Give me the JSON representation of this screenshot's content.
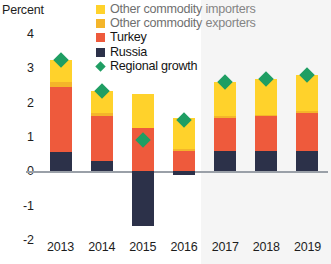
{
  "axis": {
    "y_title": "Percent",
    "y_ticks": [
      "4",
      "3",
      "2",
      "1",
      "0",
      "-1",
      "-2"
    ],
    "x_ticks": [
      "2013",
      "2014",
      "2015",
      "2016",
      "2017",
      "2018",
      "2019"
    ]
  },
  "legend": {
    "items": [
      {
        "label": "Other commodity importers",
        "color": "#FFD22B",
        "shape": "square",
        "muted": true
      },
      {
        "label": "Other commodity exporters",
        "color": "#F4B52A",
        "shape": "square",
        "muted": true
      },
      {
        "label": "Turkey",
        "color": "#EE5A3C",
        "shape": "square",
        "muted": false
      },
      {
        "label": "Russia",
        "color": "#2C3149",
        "shape": "square",
        "muted": false
      },
      {
        "label": "Regional growth",
        "color": "#1F9E63",
        "shape": "diamond",
        "muted": false
      }
    ]
  },
  "colors": {
    "other_importers": "#FFD22B",
    "other_exporters": "#F4B52A",
    "turkey": "#EE5A3C",
    "russia": "#2C3149",
    "regional_growth": "#1F9E63",
    "axis_line": "#9AA0A8",
    "background": "#FFFFFF"
  },
  "chart_data": {
    "type": "bar",
    "title": "",
    "subtitle": "",
    "xlabel": "",
    "ylabel": "Percent",
    "ylim": [
      -2,
      4
    ],
    "yticks": [
      -2,
      -1,
      0,
      1,
      2,
      3,
      4
    ],
    "grid": false,
    "stacked": true,
    "legend_position": "top-right",
    "categories": [
      "2013",
      "2014",
      "2015",
      "2016",
      "2017",
      "2018",
      "2019"
    ],
    "series": [
      {
        "name": "Russia",
        "color": "#2C3149",
        "values": [
          0.55,
          0.3,
          -1.6,
          -0.1,
          0.6,
          0.6,
          0.6
        ]
      },
      {
        "name": "Turkey",
        "color": "#EE5A3C",
        "values": [
          1.9,
          1.3,
          1.25,
          0.6,
          0.95,
          1.0,
          1.1
        ]
      },
      {
        "name": "Other commodity exporters",
        "color": "#F4B52A",
        "values": [
          0.15,
          0.1,
          0.0,
          0.05,
          0.05,
          0.05,
          0.05
        ]
      },
      {
        "name": "Other commodity importers",
        "color": "#FFD22B",
        "values": [
          0.65,
          0.65,
          1.0,
          0.9,
          1.0,
          1.05,
          1.05
        ]
      }
    ],
    "overlay": {
      "name": "Regional growth",
      "type": "marker",
      "marker": "diamond",
      "color": "#1F9E63",
      "values": [
        3.25,
        2.35,
        0.9,
        1.5,
        2.6,
        2.7,
        2.8
      ]
    },
    "forecast_from": "2017"
  }
}
